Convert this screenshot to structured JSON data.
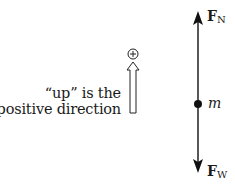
{
  "diagram": {
    "type": "free-body diagram",
    "sign_convention": {
      "symbol": "+",
      "text_line1": "“up” is the",
      "text_line2": "positive direction"
    },
    "object": {
      "label": "m"
    },
    "forces": [
      {
        "symbol": "F",
        "subscript": "N",
        "direction": "up"
      },
      {
        "symbol": "F",
        "subscript": "W",
        "direction": "down"
      }
    ]
  }
}
